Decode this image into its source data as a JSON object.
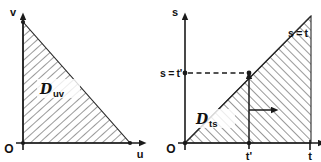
{
  "figure": {
    "background_color": "#ffffff",
    "ink_color": "#1a1a1a",
    "hatch_color": "#3a3a3a"
  },
  "panels": [
    {
      "id": "uv-plane",
      "name": "uv-domain-panel",
      "origin_label": "O",
      "vertical_axis_label": "v",
      "horizontal_axis_label": "u",
      "region_label_main": "D",
      "region_label_sub": "uv",
      "region_shape": "right-triangle",
      "hatched": true,
      "hatch_direction": "parallel-to-hypotenuse"
    },
    {
      "id": "ts-plane",
      "name": "ts-domain-panel",
      "origin_label": "O",
      "vertical_axis_label": "s",
      "horizontal_axis_label": "t",
      "region_label_main": "D",
      "region_label_sub": "ts",
      "diagonal_label": "s = t",
      "s_axis_value_label": "s = t'",
      "t_axis_tick_label": "t'",
      "t_axis_end_tick_label": "t",
      "region_shape": "triangle-below-diagonal",
      "hatched": true,
      "hatch_direction": "parallel-to-diagonal",
      "inner_arrow_vertical": "up",
      "inner_arrow_horizontal": "right"
    }
  ]
}
